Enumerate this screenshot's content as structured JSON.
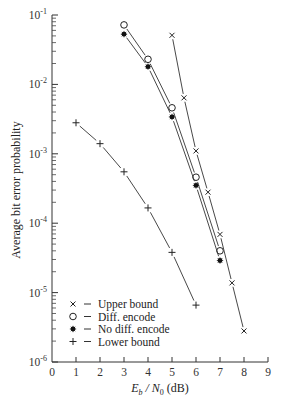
{
  "chart_data": {
    "type": "line",
    "title": "",
    "xlabel": "E_b / N_0 (dB)",
    "xlabel_parts": {
      "E": "E",
      "b": "b",
      "slash": " / ",
      "N": "N",
      "zero": "0",
      "unit": " (dB)"
    },
    "ylabel": "Average bit error probability",
    "xlim": [
      0,
      9
    ],
    "ylim": [
      1e-06,
      0.1
    ],
    "yscale": "log",
    "x_ticks": [
      0,
      1,
      2,
      3,
      4,
      5,
      6,
      7,
      8,
      9
    ],
    "x_tick_labels": [
      "0",
      "1",
      "2",
      "3",
      "4",
      "5",
      "6",
      "7",
      "8",
      "9"
    ],
    "y_ticks": [
      {
        "exp": -1,
        "base": "10",
        "sup": "-1"
      },
      {
        "exp": -2,
        "base": "10",
        "sup": "-2"
      },
      {
        "exp": -3,
        "base": "10",
        "sup": "-3"
      },
      {
        "exp": -4,
        "base": "10",
        "sup": "-4"
      },
      {
        "exp": -5,
        "base": "10",
        "sup": "-5"
      },
      {
        "exp": -6,
        "base": "10",
        "sup": "-6"
      }
    ],
    "grid": false,
    "legend_position": "lower left",
    "series": [
      {
        "name": "Upper bound",
        "marker": "x",
        "x": [
          5,
          5.5,
          6,
          6.5,
          7,
          7.5,
          8
        ],
        "y": [
          0.051,
          0.0064,
          0.0011,
          0.00028,
          6.9e-05,
          1.38e-05,
          2.8e-06
        ]
      },
      {
        "name": "Diff. encode",
        "marker": "open-circle",
        "x": [
          3,
          4,
          5,
          6,
          7
        ],
        "y": [
          0.072,
          0.023,
          0.0046,
          0.00046,
          4e-05
        ]
      },
      {
        "name": "No diff. encode",
        "marker": "filled-star",
        "x": [
          3,
          4,
          5,
          6,
          7
        ],
        "y": [
          0.053,
          0.018,
          0.0034,
          0.00035,
          2.9e-05
        ]
      },
      {
        "name": "Lower bound",
        "marker": "plus",
        "x": [
          1,
          2,
          3,
          4,
          5,
          6
        ],
        "y": [
          0.0028,
          0.0014,
          0.00055,
          0.000166,
          3.8e-05,
          6.6e-06
        ]
      }
    ],
    "legend": [
      {
        "symbol": "×",
        "marker": "x",
        "dash": "–",
        "label": "Upper bound"
      },
      {
        "symbol": "○",
        "marker": "open-circle",
        "dash": "–",
        "label": "Diff. encode"
      },
      {
        "symbol": "✱",
        "marker": "filled-star",
        "dash": "–",
        "label": "No diff. encode"
      },
      {
        "symbol": "+",
        "marker": "plus",
        "dash": "–",
        "label": "Lower bound"
      }
    ]
  }
}
